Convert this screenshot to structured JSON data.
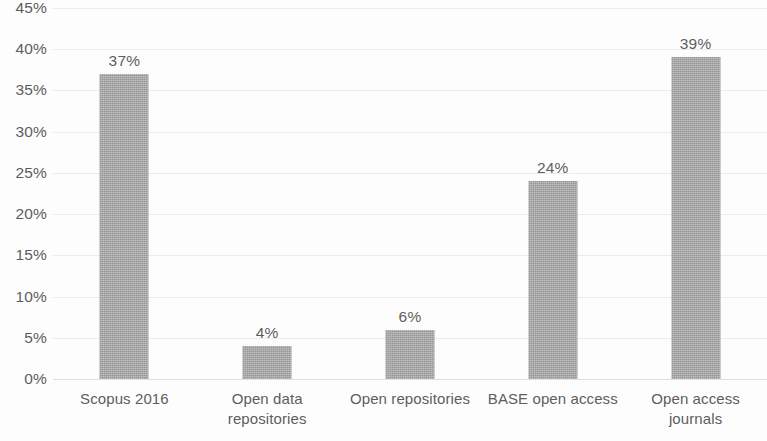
{
  "chart_data": {
    "type": "bar",
    "title": "",
    "subtitle": "",
    "xlabel": "",
    "ylabel": "",
    "categories": [
      "Scopus 2016",
      "Open data repositories",
      "Open repositories",
      "BASE open access",
      "Open access journals"
    ],
    "category_lines": [
      [
        "Scopus 2016",
        ""
      ],
      [
        "Open data",
        "repositories"
      ],
      [
        "Open repositories",
        ""
      ],
      [
        "BASE open access",
        ""
      ],
      [
        "Open access",
        "journals"
      ]
    ],
    "values": [
      37,
      4,
      6,
      24,
      39
    ],
    "data_labels": [
      "37%",
      "4%",
      "6%",
      "24%",
      "39%"
    ],
    "ylim": [
      0,
      45
    ],
    "ytick_values": [
      45,
      40,
      35,
      30,
      25,
      20,
      15,
      10,
      5,
      0
    ],
    "ytick_labels": [
      "45%",
      "40%",
      "35%",
      "30%",
      "25%",
      "20%",
      "15%",
      "10%",
      "5%",
      "0%"
    ],
    "grid": true,
    "grid_axis": "y",
    "legend": false,
    "legend_position": "none",
    "series_name": "",
    "bar_color": "#a6a6a6",
    "gridline_color": "#e8e8e8",
    "text_color": "#5d5d5d",
    "background_color": "#fdfdfd",
    "value_unit": "%"
  }
}
